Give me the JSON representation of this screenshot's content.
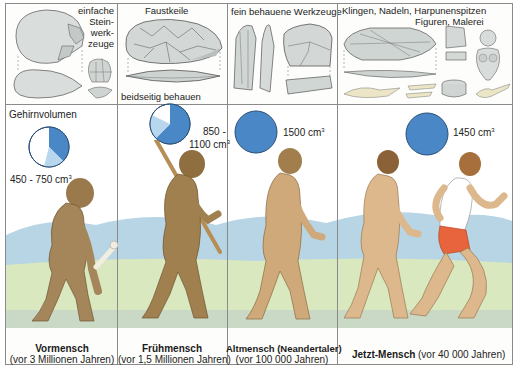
{
  "tools_row": [
    {
      "label_lines": [
        "einfache",
        "Stein-",
        "werk-",
        "zeuge"
      ],
      "icon": "pebble-tool-icon"
    },
    {
      "label": "Faustkeile",
      "sub_label": "beidseitig behauen",
      "icon": "hand-axe-icon"
    },
    {
      "label": "fein behauene Werkzeuge",
      "icon": "flake-tool-icon"
    },
    {
      "label_line1": "Klingen, Nadeln, Harpunenspitzen",
      "label_line2": "Figuren, Malerei",
      "icon": "blade-harpoon-figurine-icon"
    }
  ],
  "brain_volume_label": "Gehirnvolumen",
  "stages": [
    {
      "name": "Vormensch",
      "era": "(vor 3 Millionen Jahren)",
      "volume": "450 - 750 cm",
      "volume_sup": "3",
      "pie_fill_fraction": 0.45,
      "pie_light_fraction": 0.13
    },
    {
      "name": "Frühmensch",
      "era": "(vor 1,5 Millionen Jahren)",
      "volume_line1": "850 -",
      "volume_line2": "1100 cm",
      "volume_sup": "3",
      "pie_fill_fraction": 0.62,
      "pie_light_fraction": 0.2
    },
    {
      "name": "Altmensch (Neandertaler)",
      "era": "(vor 100 000 Jahren)",
      "volume": "1500 cm",
      "volume_sup": "3",
      "pie_fill_fraction": 1.0
    },
    {
      "name": "Jetzt-Mensch",
      "era": "(vor 40 000 Jahren)",
      "volume": "1450 cm",
      "volume_sup": "3",
      "pie_fill_fraction": 1.0
    }
  ],
  "colors": {
    "pie_dark": "#4a87c6",
    "pie_light": "#b9d6ef",
    "pie_outline": "#2a4f78",
    "sky": "#ffffff",
    "hills": "#a9cde0",
    "grass": "#d6e6b8",
    "skin_early": "#a5865a",
    "skin_modern": "#d8b58a",
    "shorts": "#e8643c",
    "divider": "#8a8a8a"
  }
}
